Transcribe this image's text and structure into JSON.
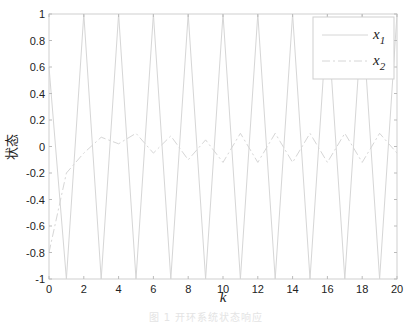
{
  "chart_data": {
    "type": "line",
    "title": "",
    "xlabel": "k",
    "ylabel": "状态",
    "xlim": [
      0,
      20
    ],
    "ylim": [
      -1,
      1
    ],
    "xticks": [
      0,
      2,
      4,
      6,
      8,
      10,
      12,
      14,
      16,
      18,
      20
    ],
    "yticks": [
      -1,
      -0.8,
      -0.6,
      -0.4,
      -0.2,
      0,
      0.2,
      0.4,
      0.6,
      0.8,
      1
    ],
    "ytick_labels": [
      "-1",
      "-0.8",
      "-0.6",
      "-0.4",
      "-0.2",
      "0",
      "0.2",
      "0.4",
      "0.6",
      "0.8",
      "1"
    ],
    "grid": false,
    "legend_position": "upper right",
    "x": [
      0,
      1,
      2,
      3,
      4,
      5,
      6,
      7,
      8,
      9,
      10,
      11,
      12,
      13,
      14,
      15,
      16,
      17,
      18,
      19,
      20
    ],
    "series": [
      {
        "name": "x1",
        "label_base": "x",
        "label_sub": "1",
        "style": "solid",
        "color": "#d6d6d6",
        "values": [
          0.6,
          -1,
          1,
          -1,
          1,
          -1,
          1,
          -1,
          1,
          -1,
          1,
          -1,
          1,
          -1,
          1,
          -1,
          1,
          -1,
          1,
          -1,
          1
        ]
      },
      {
        "name": "x2",
        "label_base": "x",
        "label_sub": "2",
        "style": "dashdot",
        "color": "#d6d6d6",
        "values": [
          -0.8,
          -0.2,
          -0.05,
          0.07,
          0.02,
          0.1,
          -0.05,
          0.08,
          -0.1,
          0.05,
          -0.12,
          0.1,
          -0.12,
          0.1,
          -0.12,
          0.1,
          -0.12,
          0.1,
          -0.12,
          0.1,
          -0.05
        ]
      }
    ],
    "caption": "图 1 开环系统状态响应"
  }
}
